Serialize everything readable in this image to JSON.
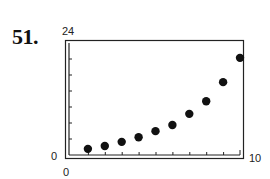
{
  "problem": {
    "number_label": "51."
  },
  "axes": {
    "y_max_label": "24",
    "y_min_label": "0",
    "x_min_label": "0",
    "x_max_label": "10"
  },
  "chart_data": {
    "type": "scatter",
    "title": "",
    "xlabel": "",
    "ylabel": "",
    "xlim": [
      0,
      10
    ],
    "ylim": [
      0,
      24
    ],
    "grid": false,
    "legend": null,
    "x_ticks": [
      1,
      2,
      3,
      4,
      5,
      6,
      7,
      8,
      9
    ],
    "y_ticks_count": 6,
    "tick_labels": {
      "x": [
        "0",
        "10"
      ],
      "y": [
        "0",
        "24"
      ]
    },
    "series": [
      {
        "name": "data",
        "marker": "filled-circle",
        "color": "#111111",
        "x": [
          1,
          2,
          3,
          4,
          5,
          6,
          7,
          8,
          9,
          10
        ],
        "y": [
          1.1,
          1.7,
          2.6,
          3.6,
          4.9,
          6.2,
          8.6,
          11.3,
          15.4,
          20.6
        ]
      }
    ]
  }
}
